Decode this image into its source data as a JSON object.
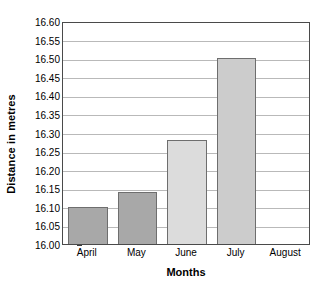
{
  "chart_data": {
    "type": "bar",
    "title": "",
    "xlabel": "Months",
    "ylabel": "Distance in metres",
    "categories": [
      "April",
      "May",
      "June",
      "July",
      "August"
    ],
    "values": [
      16.1,
      16.14,
      16.28,
      16.5,
      null
    ],
    "ylim": [
      16.0,
      16.6
    ],
    "ytick_step": 0.05,
    "ytick_labels": [
      "16.00",
      "16.05",
      "16.10",
      "16.15",
      "16.20",
      "16.25",
      "16.30",
      "16.35",
      "16.40",
      "16.45",
      "16.50",
      "16.55",
      "16.60"
    ],
    "ytick_values": [
      16.0,
      16.05,
      16.1,
      16.15,
      16.2,
      16.25,
      16.3,
      16.35,
      16.4,
      16.45,
      16.5,
      16.55,
      16.6
    ],
    "grid": "horizontal",
    "legend": "none",
    "bar_colors": [
      "#a8a8a8",
      "#a8a8a8",
      "#dcdcdc",
      "#cccccc",
      "#ffffff"
    ],
    "bar_border_color": "#6e6e6e",
    "axis_color": "#4a4a4a",
    "gridline_color": "#b9b9b9"
  }
}
